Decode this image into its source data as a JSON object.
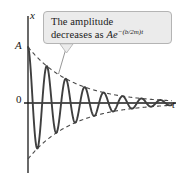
{
  "figure": {
    "background_color": "#ffffff"
  },
  "axes": {
    "y_axis_label": "x",
    "x_axis_label": "t",
    "origin_label": "0",
    "amplitude_label": "A",
    "axis_color": "#1a1a1a"
  },
  "callout": {
    "line1": "The amplitude",
    "line2_prefix": "decreases as ",
    "formula_base": "Ae",
    "formula_exponent": "−(b/2m)t",
    "full_text": "The amplitude decreases as Ae−(b/2m)t",
    "background_color": "#ebebeb",
    "border_color": "#b4b4b4"
  },
  "chart_data": {
    "type": "line",
    "xlabel": "t",
    "ylabel": "x",
    "grid": false,
    "legend": null,
    "annotations": [
      "The amplitude decreases as Ae^-(b/2m)t"
    ],
    "axis_ranges": {
      "x": [
        0,
        7.6
      ],
      "y": [
        -1.15,
        1.15
      ]
    },
    "tick_labels": {
      "y": [
        "0",
        "A"
      ],
      "x": []
    },
    "series": [
      {
        "name": "displacement",
        "style": "solid",
        "color": "#3f3f3f",
        "description": "x(t) = A e^{-(b/2m)t} cos(wt)",
        "params": {
          "A": 1.0,
          "decay_gamma": 0.42,
          "omega": 6.283,
          "phase": 0.0
        },
        "x": [
          0.0,
          0.25,
          0.5,
          0.75,
          1.0,
          1.25,
          1.5,
          1.75,
          2.0,
          2.25,
          2.5,
          2.75,
          3.0,
          3.25,
          3.5,
          3.75,
          4.0,
          4.25,
          4.5,
          4.75,
          5.0,
          5.25,
          5.5,
          5.75,
          6.0,
          6.25,
          6.5,
          6.75,
          7.0
        ],
        "y": [
          1.0,
          0.0,
          -0.81,
          0.0,
          0.657,
          0.0,
          -0.532,
          0.0,
          0.431,
          0.0,
          -0.349,
          0.0,
          0.283,
          0.0,
          -0.229,
          0.0,
          0.186,
          0.0,
          -0.15,
          0.0,
          0.122,
          0.0,
          -0.099,
          0.0,
          0.08,
          0.0,
          -0.065,
          0.0,
          0.052
        ]
      },
      {
        "name": "upper-envelope",
        "style": "dashed",
        "color": "#4a4a4a",
        "description": "x = +A e^{-(b/2m)t}",
        "x": [
          0.0,
          1.0,
          2.0,
          3.0,
          4.0,
          5.0,
          6.0,
          7.0
        ],
        "y": [
          1.0,
          0.657,
          0.431,
          0.283,
          0.186,
          0.122,
          0.08,
          0.052
        ]
      },
      {
        "name": "lower-envelope",
        "style": "dashed",
        "color": "#4a4a4a",
        "description": "x = -A e^{-(b/2m)t}",
        "x": [
          0.0,
          1.0,
          2.0,
          3.0,
          4.0,
          5.0,
          6.0,
          7.0
        ],
        "y": [
          -1.0,
          -0.657,
          -0.431,
          -0.283,
          -0.186,
          -0.122,
          -0.08,
          -0.052
        ]
      }
    ]
  }
}
